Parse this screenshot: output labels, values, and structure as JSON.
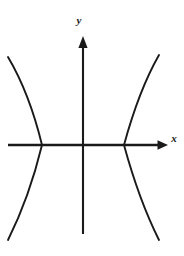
{
  "figure": {
    "background_color": "#ffffff",
    "stroke_color": "#1a1a1a",
    "width": 184,
    "height": 256
  },
  "axes": {
    "x_axis": {
      "label": "x",
      "label_x": 171,
      "label_y": 142,
      "line_y": 145,
      "line_x_start": 8,
      "line_x_end": 160,
      "arrow_tip_x": 168,
      "arrow": "right"
    },
    "y_axis": {
      "label": "y",
      "label_x": 79,
      "label_y": 24,
      "line_x": 83,
      "line_y_start": 234,
      "line_y_end": 44,
      "arrow_tip_y": 36,
      "arrow": "up"
    },
    "origin": {
      "x": 83,
      "y": 145
    }
  },
  "chart_data": {
    "type": "line",
    "xlabel": "x",
    "ylabel": "y",
    "grid": false,
    "legend": "none",
    "equation": "x^2/a^2 - y^2/b^2 = 1",
    "orientation": "horizontal",
    "center": [
      0,
      0
    ],
    "vertices_px": [
      [
        42,
        145
      ],
      [
        124,
        145
      ]
    ],
    "vertex_offset_px": 41,
    "series": [
      {
        "name": "left-branch",
        "path": "M 8 57 C 24 84, 34 112, 42 145 C 34 178, 24 208, 8 240"
      },
      {
        "name": "right-branch",
        "path": "M 159 55 C 143 83, 133 112, 124 145 C 133 178, 143 208, 159 240"
      }
    ],
    "asymptote_slope_px": 2.2,
    "x_extent_px": [
      8,
      168
    ],
    "y_extent_px": [
      36,
      240
    ]
  }
}
